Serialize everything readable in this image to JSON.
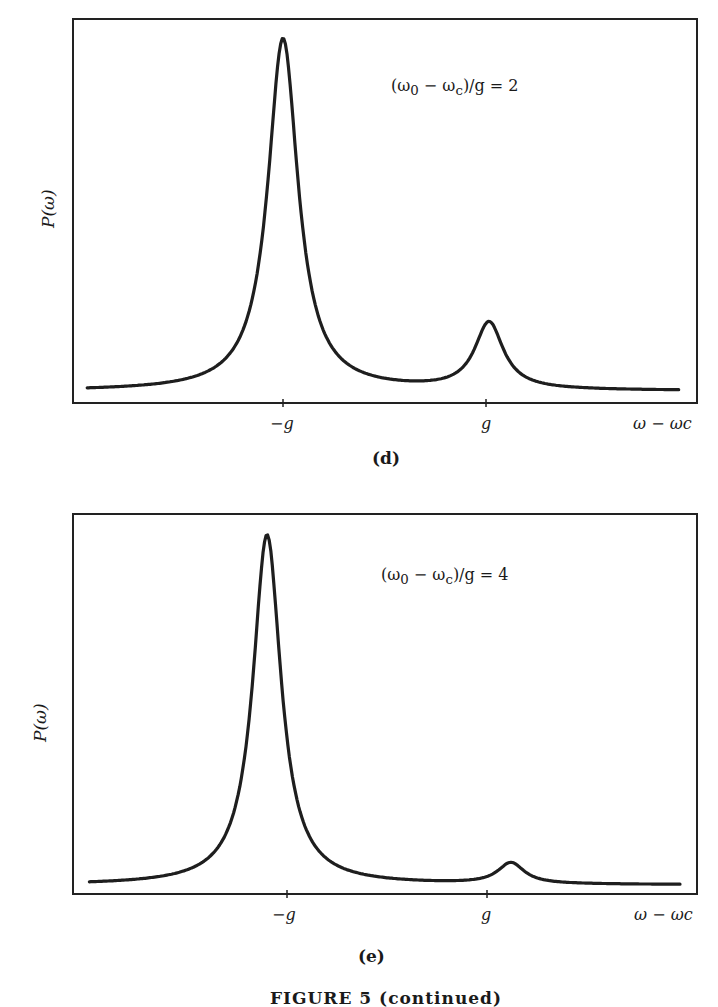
{
  "figure_caption": "FIGURE 5 (continued)",
  "chart_data": [
    {
      "type": "line",
      "panel_label": "(d)",
      "title": "",
      "annotation": "(ω0 − ωc)/g = 2",
      "annotation_parts": {
        "lhs": "(ω",
        "sub0": "0",
        "mid": " − ω",
        "subc": "c",
        "rhs": ")/g = 2"
      },
      "xlabel": "ω − ωc",
      "ylabel": "P(ω)",
      "x_ticks": [
        "−g",
        "g"
      ],
      "x_tick_positions": [
        -1,
        1
      ],
      "grid": false,
      "legend": null,
      "xlim": [
        -3.1,
        3.1
      ],
      "ylim": [
        0,
        1.03
      ],
      "description": "Two-peak emission spectrum: tall narrow peak near ω−ωc ≈ −g, small peak near ω−ωc ≈ +g",
      "series": [
        {
          "name": "P(ω)",
          "peaks": [
            {
              "x": -1.0,
              "height": 1.0,
              "hwhm": 0.18
            },
            {
              "x": 1.03,
              "height": 0.19,
              "hwhm": 0.17
            }
          ],
          "baseline": 0.0
        }
      ]
    },
    {
      "type": "line",
      "panel_label": "(e)",
      "title": "",
      "annotation": "(ω0 − ωc)/g = 4",
      "annotation_parts": {
        "lhs": "(ω",
        "sub0": "0",
        "mid": " − ω",
        "subc": "c",
        "rhs": ")/g = 4"
      },
      "xlabel": "ω − ωc",
      "ylabel": "P(ω)",
      "x_ticks": [
        "−g",
        "g"
      ],
      "x_tick_positions": [
        -1,
        1
      ],
      "grid": false,
      "legend": null,
      "xlim": [
        -3.1,
        3.1
      ],
      "ylim": [
        0,
        1.03
      ],
      "description": "Dominant narrow peak slightly below −g, very small peak slightly above +g",
      "series": [
        {
          "name": "P(ω)",
          "peaks": [
            {
              "x": -1.2,
              "height": 1.0,
              "hwhm": 0.17
            },
            {
              "x": 1.24,
              "height": 0.06,
              "hwhm": 0.16
            }
          ],
          "baseline": 0.0
        }
      ]
    }
  ]
}
